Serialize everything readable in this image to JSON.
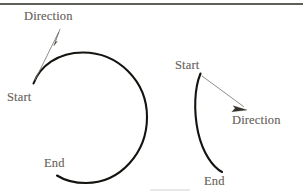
{
  "figure": {
    "background_color": "#ffffff",
    "arc_color": "#15130f",
    "arrow_color": "#7e7a72",
    "arrowhead_color": "#332f29",
    "label_color": "#6f6b64",
    "rule_color": "#2b2822",
    "top_rule": {
      "name": "horizontal-rule",
      "x1": 0,
      "y1": 4,
      "x2": 303,
      "y2": 4
    },
    "diagrams": [
      {
        "id": "left",
        "name": "clockwise-full-circle-arc",
        "description": "Nearly complete circle drawn clockwise",
        "arc_path": "M 33.5 83.5 C 40 66 58 52.5 83 52.5 C 118 52.5 147 81 147 117 C 147 153 120 183 86 183 C 74 183 64 180 57 175.5",
        "center": {
          "x": 83,
          "y": 117
        },
        "radius": 64,
        "sweep": "clockwise",
        "labels": [
          {
            "name": "direction-label-left",
            "text": "Direction",
            "x": 24,
            "y": 10
          },
          {
            "name": "start-label-left",
            "text": "Start",
            "x": 7,
            "y": 91
          },
          {
            "name": "end-label-left",
            "text": "End",
            "x": 44,
            "y": 157
          }
        ],
        "arrow": {
          "name": "direction-arrow-left",
          "shaft": {
            "x1": 35,
            "y1": 80,
            "x2": 58.5,
            "y2": 32.5
          },
          "tip": {
            "x": 60,
            "y": 29
          },
          "head_points": "60,29 55.2,42.4 57.4,41.2 53.8,45.8",
          "points_toward": "up-right"
        }
      },
      {
        "id": "right",
        "name": "clockwise-open-arc",
        "description": "Shallow arc bowing left, drawn clockwise",
        "arc_path": "M 200.5 73.5 C 194.5 88 193.5 110 198 132 C 203 154 213 167 222 172",
        "sweep": "clockwise",
        "labels": [
          {
            "name": "start-label-right",
            "text": "Start",
            "x": 175,
            "y": 59
          },
          {
            "name": "direction-label-right",
            "text": "Direction",
            "x": 232,
            "y": 114
          },
          {
            "name": "end-label-right",
            "text": "End",
            "x": 204,
            "y": 175
          }
        ],
        "arrow": {
          "name": "direction-arrow-right",
          "shaft": {
            "x1": 202,
            "y1": 76,
            "x2": 243.5,
            "y2": 106.5
          },
          "tip": {
            "x": 247,
            "y": 110
          },
          "head_points": "247,110 233.2,105.8 235.1,108.3 231.9,111.7",
          "points_toward": "down-right"
        }
      }
    ]
  }
}
